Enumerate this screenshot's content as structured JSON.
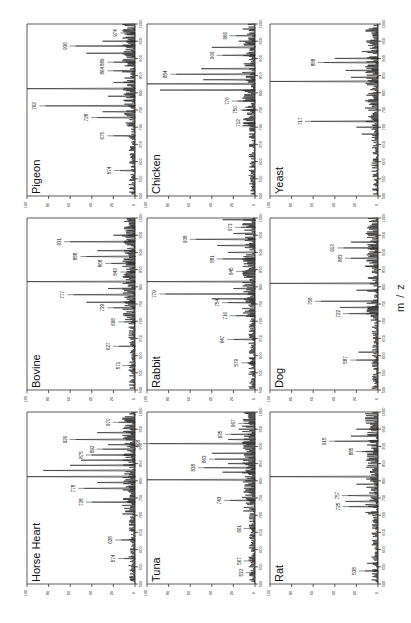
{
  "figure": {
    "xlabel": "m / z",
    "intensity_ticks": [
      "100",
      "80",
      "60",
      "40",
      "20",
      "0"
    ],
    "mz_ticks": [
      "500",
      "550",
      "600",
      "650",
      "700",
      "750",
      "800",
      "850",
      "900",
      "950",
      "1000"
    ]
  },
  "chart_data": [
    {
      "type": "line",
      "title": "Pigeon",
      "xlabel": "m / z",
      "ylabel": "Relative Intensity (%)",
      "xlim": [
        500,
        1000
      ],
      "ylim": [
        0,
        100
      ],
      "grid": false,
      "labeled_peaks": [
        {
          "mz": 574,
          "intensity": 14
        },
        {
          "mz": 675,
          "intensity": 20
        },
        {
          "mz": 728,
          "intensity": 35
        },
        {
          "mz": 762,
          "intensity": 83
        },
        {
          "mz": 864,
          "intensity": 20
        },
        {
          "mz": 889,
          "intensity": 20
        },
        {
          "mz": 936,
          "intensity": 55
        },
        {
          "mz": 974,
          "intensity": 8
        }
      ],
      "base_peak": {
        "mz": 812,
        "intensity": 100
      },
      "other_peaks": [
        [
          745,
          30
        ],
        [
          790,
          25
        ],
        [
          830,
          20
        ],
        [
          915,
          45
        ],
        [
          950,
          30
        ]
      ]
    },
    {
      "type": "line",
      "title": "Chicken",
      "xlabel": "m / z",
      "ylabel": "Relative Intensity (%)",
      "xlim": [
        500,
        1000
      ],
      "ylim": [
        0,
        100
      ],
      "grid": false,
      "labeled_peaks": [
        {
          "mz": 712,
          "intensity": 6
        },
        {
          "mz": 750,
          "intensity": 8
        },
        {
          "mz": 776,
          "intensity": 16
        },
        {
          "mz": 854,
          "intensity": 73
        },
        {
          "mz": 909,
          "intensity": 30
        },
        {
          "mz": 966,
          "intensity": 18
        }
      ],
      "base_peak": {
        "mz": 826,
        "intensity": 100
      },
      "other_peaks": [
        [
          808,
          88
        ],
        [
          838,
          48
        ],
        [
          870,
          50
        ],
        [
          932,
          40
        ],
        [
          950,
          15
        ]
      ]
    },
    {
      "type": "line",
      "title": "Yeast",
      "xlabel": "m / z",
      "ylabel": "Relative Intensity (%)",
      "xlim": [
        500,
        1000
      ],
      "ylim": [
        0,
        100
      ],
      "grid": false,
      "labeled_peaks": [
        {
          "mz": 717,
          "intensity": 62
        },
        {
          "mz": 888,
          "intensity": 50
        }
      ],
      "base_peak": {
        "mz": 833,
        "intensity": 100
      },
      "other_peaks": [
        [
          680,
          15
        ],
        [
          700,
          20
        ],
        [
          845,
          25
        ],
        [
          865,
          30
        ],
        [
          900,
          40
        ],
        [
          920,
          15
        ]
      ]
    },
    {
      "type": "line",
      "title": "Bovine",
      "xlabel": "m / z",
      "ylabel": "Relative Intensity (%)",
      "xlim": [
        500,
        1000
      ],
      "ylim": [
        0,
        100
      ],
      "grid": false,
      "labeled_peaks": [
        {
          "mz": 571,
          "intensity": 6
        },
        {
          "mz": 627,
          "intensity": 15
        },
        {
          "mz": 698,
          "intensity": 10
        },
        {
          "mz": 739,
          "intensity": 20
        },
        {
          "mz": 777,
          "intensity": 57
        },
        {
          "mz": 843,
          "intensity": 8
        },
        {
          "mz": 868,
          "intensity": 22
        },
        {
          "mz": 888,
          "intensity": 45
        },
        {
          "mz": 931,
          "intensity": 60
        }
      ],
      "base_peak": {
        "mz": 815,
        "intensity": 100
      },
      "other_peaks": [
        [
          755,
          45
        ],
        [
          795,
          25
        ],
        [
          905,
          35
        ],
        [
          950,
          20
        ],
        [
          973,
          10
        ]
      ]
    },
    {
      "type": "line",
      "title": "Rabbit",
      "xlabel": "m / z",
      "ylabel": "Relative Intensity (%)",
      "xlim": [
        500,
        1000
      ],
      "ylim": [
        0,
        100
      ],
      "grid": false,
      "labeled_peaks": [
        {
          "mz": 579,
          "intensity": 7
        },
        {
          "mz": 647,
          "intensity": 20
        },
        {
          "mz": 716,
          "intensity": 18
        },
        {
          "mz": 754,
          "intensity": 25
        },
        {
          "mz": 779,
          "intensity": 83
        },
        {
          "mz": 845,
          "intensity": 12
        },
        {
          "mz": 881,
          "intensity": 30
        },
        {
          "mz": 938,
          "intensity": 55
        },
        {
          "mz": 973,
          "intensity": 13
        }
      ],
      "base_peak": {
        "mz": 815,
        "intensity": 100
      },
      "other_peaks": [
        [
          765,
          40
        ],
        [
          795,
          20
        ],
        [
          900,
          25
        ],
        [
          920,
          35
        ],
        [
          955,
          20
        ],
        [
          995,
          30
        ]
      ]
    },
    {
      "type": "line",
      "title": "Dog",
      "xlabel": "m / z",
      "ylabel": "Relative Intensity (%)",
      "xlim": [
        500,
        1000
      ],
      "ylim": [
        0,
        100
      ],
      "grid": false,
      "labeled_peaks": [
        {
          "mz": 587,
          "intensity": 20
        },
        {
          "mz": 722,
          "intensity": 27
        },
        {
          "mz": 758,
          "intensity": 53
        },
        {
          "mz": 883,
          "intensity": 25
        },
        {
          "mz": 913,
          "intensity": 32
        }
      ],
      "base_peak": {
        "mz": 810,
        "intensity": 100
      },
      "other_peaks": [
        [
          610,
          18
        ],
        [
          740,
          35
        ],
        [
          790,
          20
        ],
        [
          860,
          12
        ],
        [
          930,
          25
        ]
      ]
    },
    {
      "type": "line",
      "title": "Horse Heart",
      "xlabel": "m / z",
      "ylabel": "Relative Intensity (%)",
      "xlim": [
        500,
        1000
      ],
      "ylim": [
        0,
        100
      ],
      "grid": false,
      "labeled_peaks": [
        {
          "mz": 574,
          "intensity": 10
        },
        {
          "mz": 628,
          "intensity": 13
        },
        {
          "mz": 738,
          "intensity": 40
        },
        {
          "mz": 778,
          "intensity": 47
        },
        {
          "mz": 875,
          "intensity": 40
        },
        {
          "mz": 892,
          "intensity": 30
        },
        {
          "mz": 920,
          "intensity": 55
        },
        {
          "mz": 970,
          "intensity": 15
        }
      ],
      "base_peak": {
        "mz": 812,
        "intensity": 100
      },
      "other_peaks": [
        [
          795,
          35
        ],
        [
          830,
          85
        ],
        [
          845,
          60
        ],
        [
          860,
          50
        ],
        [
          905,
          25
        ],
        [
          940,
          35
        ]
      ]
    },
    {
      "type": "line",
      "title": "Tuna",
      "xlabel": "m / z",
      "ylabel": "Relative Intensity (%)",
      "xlim": [
        500,
        1000
      ],
      "ylim": [
        0,
        100
      ],
      "grid": false,
      "labeled_peaks": [
        {
          "mz": 533,
          "intensity": 3
        },
        {
          "mz": 567,
          "intensity": 5
        },
        {
          "mz": 661,
          "intensity": 5
        },
        {
          "mz": 743,
          "intensity": 23
        },
        {
          "mz": 838,
          "intensity": 47
        },
        {
          "mz": 863,
          "intensity": 37
        },
        {
          "mz": 908,
          "intensity": 98
        },
        {
          "mz": 935,
          "intensity": 22
        },
        {
          "mz": 967,
          "intensity": 10
        }
      ],
      "base_peak": {
        "mz": 803,
        "intensity": 100
      },
      "other_peaks": [
        [
          825,
          30
        ],
        [
          850,
          25
        ],
        [
          880,
          40
        ],
        [
          920,
          25
        ],
        [
          950,
          15
        ]
      ]
    },
    {
      "type": "line",
      "title": "Rat",
      "xlabel": "m / z",
      "ylabel": "Relative Intensity (%)",
      "xlim": [
        500,
        1000
      ],
      "ylim": [
        0,
        100
      ],
      "grid": false,
      "labeled_peaks": [
        {
          "mz": 538,
          "intensity": 12
        },
        {
          "mz": 725,
          "intensity": 27
        },
        {
          "mz": 757,
          "intensity": 28
        },
        {
          "mz": 885,
          "intensity": 15
        },
        {
          "mz": 915,
          "intensity": 40
        }
      ],
      "base_peak": {
        "mz": 812,
        "intensity": 100
      },
      "other_peaks": [
        [
          560,
          10
        ],
        [
          740,
          30
        ],
        [
          790,
          20
        ],
        [
          930,
          25
        ],
        [
          950,
          20
        ]
      ]
    }
  ]
}
